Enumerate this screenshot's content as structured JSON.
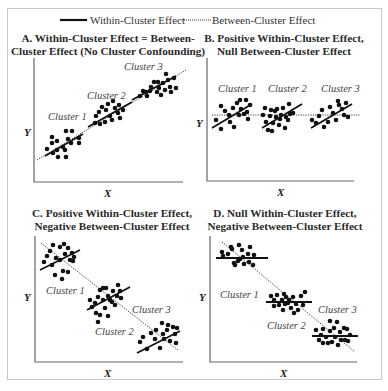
{
  "legend": {
    "within_label": "Within-Cluster Effect",
    "between_label": "Between-Cluster Effect"
  },
  "colors": {
    "dot": "#111111",
    "axis": "#555555",
    "frame": "#c8c8c8"
  },
  "panels": [
    {
      "id": "A",
      "title_line1": "A.  Within-Cluster Effect = Between-",
      "title_line2": "Cluster Effect (No Cluster Confounding)",
      "x_label": "X",
      "y_label": "Y",
      "cluster_labels": [
        "Cluster 1",
        "Cluster 2",
        "Cluster 3"
      ]
    },
    {
      "id": "B",
      "title_line1": "B.  Positive Within-Cluster Effect,",
      "title_line2": "Null Between-Cluster Effect",
      "x_label": "X",
      "y_label": "Y",
      "cluster_labels": [
        "Cluster 1",
        "Cluster 2",
        "Cluster 3"
      ]
    },
    {
      "id": "C",
      "title_line1": "C.  Positive Within-Cluster Effect,",
      "title_line2": "Negative Between-Cluster Effect",
      "x_label": "X",
      "y_label": "Y",
      "cluster_labels": [
        "Cluster 1",
        "Cluster 2",
        "Cluster 3"
      ]
    },
    {
      "id": "D",
      "title_line1": "D.  Null Within-Cluster Effect,",
      "title_line2": "Negative Between-Cluster Effect",
      "x_label": "X",
      "y_label": "Y",
      "cluster_labels": [
        "Cluster 1",
        "Cluster 2",
        "Cluster 3"
      ]
    }
  ],
  "plots": {
    "A": {
      "between": [
        37,
        160,
        186,
        70
      ],
      "within": [
        [
          45,
          156,
          83,
          134
        ],
        [
          88,
          127,
          132,
          102
        ],
        [
          132,
          100,
          176,
          76
        ]
      ],
      "dots": [
        [
          52,
          137
        ],
        [
          52,
          143
        ],
        [
          57,
          141
        ],
        [
          66,
          131
        ],
        [
          72,
          131
        ],
        [
          68,
          139
        ],
        [
          71,
          143
        ],
        [
          63,
          147
        ],
        [
          65,
          150
        ],
        [
          57,
          150
        ],
        [
          53,
          153
        ],
        [
          47,
          149
        ],
        [
          58,
          157
        ],
        [
          66,
          157
        ],
        [
          79,
          138
        ],
        [
          79,
          143
        ],
        [
          96,
          116
        ],
        [
          99,
          112
        ],
        [
          102,
          107
        ],
        [
          106,
          110
        ],
        [
          108,
          104
        ],
        [
          110,
          116
        ],
        [
          112,
          120
        ],
        [
          105,
          122
        ],
        [
          100,
          124
        ],
        [
          95,
          123
        ],
        [
          115,
          108
        ],
        [
          118,
          113
        ],
        [
          120,
          118
        ],
        [
          123,
          110
        ],
        [
          119,
          105
        ],
        [
          113,
          101
        ],
        [
          140,
          96
        ],
        [
          143,
          91
        ],
        [
          147,
          96
        ],
        [
          150,
          91
        ],
        [
          151,
          87
        ],
        [
          154,
          82
        ],
        [
          157,
          92
        ],
        [
          159,
          88
        ],
        [
          161,
          95
        ],
        [
          163,
          83
        ],
        [
          165,
          90
        ],
        [
          168,
          80
        ],
        [
          170,
          87
        ],
        [
          171,
          92
        ],
        [
          174,
          78
        ],
        [
          176,
          88
        ],
        [
          166,
          74
        ],
        [
          158,
          82
        ],
        [
          146,
          92
        ]
      ],
      "labels": [
        [
          48,
          120
        ],
        [
          87,
          99
        ],
        [
          124,
          70
        ]
      ]
    },
    "B": {
      "between": [
        212,
        115,
        360,
        115
      ],
      "within": [
        [
          212,
          128,
          252,
          104
        ],
        [
          262,
          128,
          302,
          104
        ],
        [
          311,
          128,
          352,
          104
        ]
      ],
      "dots": [
        [
          216,
          120
        ],
        [
          221,
          106
        ],
        [
          225,
          111
        ],
        [
          221,
          129
        ],
        [
          229,
          115
        ],
        [
          230,
          122
        ],
        [
          233,
          108
        ],
        [
          234,
          127
        ],
        [
          237,
          103
        ],
        [
          239,
          115
        ],
        [
          240,
          100
        ],
        [
          241,
          109
        ],
        [
          244,
          114
        ],
        [
          246,
          100
        ],
        [
          247,
          112
        ],
        [
          248,
          119
        ],
        [
          250,
          105
        ],
        [
          263,
          115
        ],
        [
          265,
          108
        ],
        [
          266,
          122
        ],
        [
          268,
          130
        ],
        [
          270,
          116
        ],
        [
          271,
          110
        ],
        [
          272,
          131
        ],
        [
          273,
          123
        ],
        [
          275,
          111
        ],
        [
          276,
          117
        ],
        [
          277,
          109
        ],
        [
          279,
          125
        ],
        [
          280,
          119
        ],
        [
          281,
          115
        ],
        [
          283,
          108
        ],
        [
          285,
          128
        ],
        [
          286,
          117
        ],
        [
          289,
          104
        ],
        [
          290,
          114
        ],
        [
          293,
          113
        ],
        [
          288,
          120
        ],
        [
          312,
          120
        ],
        [
          316,
          123
        ],
        [
          319,
          116
        ],
        [
          322,
          110
        ],
        [
          324,
          127
        ],
        [
          328,
          122
        ],
        [
          330,
          107
        ],
        [
          333,
          113
        ],
        [
          336,
          120
        ],
        [
          338,
          101
        ],
        [
          339,
          105
        ],
        [
          342,
          109
        ],
        [
          344,
          115
        ],
        [
          346,
          103
        ],
        [
          348,
          117
        ]
      ],
      "labels": [
        [
          218,
          92
        ],
        [
          268,
          92
        ],
        [
          321,
          92
        ]
      ]
    },
    "C": {
      "between": [
        41,
        243,
        178,
        350
      ],
      "within": [
        [
          40,
          270,
          80,
          250
        ],
        [
          87,
          310,
          130,
          287
        ],
        [
          137,
          353,
          180,
          331
        ]
      ],
      "dots": [
        [
          44,
          262
        ],
        [
          47,
          256
        ],
        [
          50,
          251
        ],
        [
          52,
          265
        ],
        [
          55,
          275
        ],
        [
          56,
          258
        ],
        [
          60,
          260
        ],
        [
          60,
          247
        ],
        [
          63,
          271
        ],
        [
          65,
          254
        ],
        [
          68,
          248
        ],
        [
          70,
          260
        ],
        [
          72,
          253
        ],
        [
          74,
          257
        ],
        [
          68,
          272
        ],
        [
          62,
          279
        ],
        [
          73,
          261
        ],
        [
          53,
          245
        ],
        [
          64,
          244
        ],
        [
          90,
          300
        ],
        [
          92,
          307
        ],
        [
          95,
          303
        ],
        [
          96,
          313
        ],
        [
          98,
          297
        ],
        [
          100,
          290
        ],
        [
          100,
          315
        ],
        [
          103,
          288
        ],
        [
          103,
          300
        ],
        [
          105,
          308
        ],
        [
          108,
          296
        ],
        [
          108,
          316
        ],
        [
          110,
          300
        ],
        [
          112,
          302
        ],
        [
          113,
          291
        ],
        [
          115,
          305
        ],
        [
          117,
          296
        ],
        [
          118,
          285
        ],
        [
          120,
          291
        ],
        [
          121,
          298
        ],
        [
          106,
          288
        ],
        [
          98,
          322
        ],
        [
          140,
          342
        ],
        [
          143,
          337
        ],
        [
          147,
          349
        ],
        [
          151,
          333
        ],
        [
          155,
          339
        ],
        [
          156,
          330
        ],
        [
          160,
          348
        ],
        [
          163,
          334
        ],
        [
          164,
          339
        ],
        [
          167,
          330
        ],
        [
          168,
          325
        ],
        [
          170,
          341
        ],
        [
          173,
          327
        ],
        [
          175,
          334
        ],
        [
          177,
          328
        ],
        [
          176,
          343
        ],
        [
          162,
          323
        ]
      ],
      "labels": [
        [
          46,
          294
        ],
        [
          95,
          335
        ],
        [
          132,
          313
        ]
      ]
    },
    "D": {
      "between": [
        222,
        242,
        355,
        352
      ],
      "within": [
        [
          216,
          258,
          268,
          258
        ],
        [
          266,
          302,
          312,
          302
        ],
        [
          312,
          336,
          358,
          336
        ]
      ],
      "dots": [
        [
          222,
          252
        ],
        [
          223,
          256
        ],
        [
          228,
          254
        ],
        [
          231,
          247
        ],
        [
          232,
          249
        ],
        [
          235,
          265
        ],
        [
          234,
          263
        ],
        [
          238,
          261
        ],
        [
          240,
          259
        ],
        [
          242,
          250
        ],
        [
          243,
          257
        ],
        [
          244,
          264
        ],
        [
          248,
          254
        ],
        [
          250,
          247
        ],
        [
          249,
          262
        ],
        [
          254,
          255
        ],
        [
          253,
          265
        ],
        [
          239,
          245
        ],
        [
          271,
          296
        ],
        [
          274,
          300
        ],
        [
          274,
          306
        ],
        [
          277,
          295
        ],
        [
          279,
          305
        ],
        [
          282,
          300
        ],
        [
          283,
          310
        ],
        [
          285,
          304
        ],
        [
          286,
          297
        ],
        [
          288,
          303
        ],
        [
          289,
          300
        ],
        [
          291,
          308
        ],
        [
          293,
          297
        ],
        [
          294,
          313
        ],
        [
          296,
          304
        ],
        [
          298,
          310
        ],
        [
          301,
          296
        ],
        [
          303,
          305
        ],
        [
          305,
          292
        ],
        [
          284,
          294
        ],
        [
          316,
          330
        ],
        [
          319,
          340
        ],
        [
          323,
          343
        ],
        [
          323,
          329
        ],
        [
          326,
          337
        ],
        [
          328,
          343
        ],
        [
          330,
          331
        ],
        [
          332,
          342
        ],
        [
          334,
          328
        ],
        [
          335,
          337
        ],
        [
          337,
          322
        ],
        [
          338,
          345
        ],
        [
          340,
          332
        ],
        [
          341,
          340
        ],
        [
          344,
          328
        ],
        [
          345,
          340
        ],
        [
          347,
          329
        ],
        [
          348,
          341
        ],
        [
          350,
          335
        ],
        [
          330,
          321
        ],
        [
          321,
          335
        ]
      ],
      "labels": [
        [
          220,
          298
        ],
        [
          267,
          329
        ],
        [
          318,
          313
        ]
      ]
    }
  }
}
